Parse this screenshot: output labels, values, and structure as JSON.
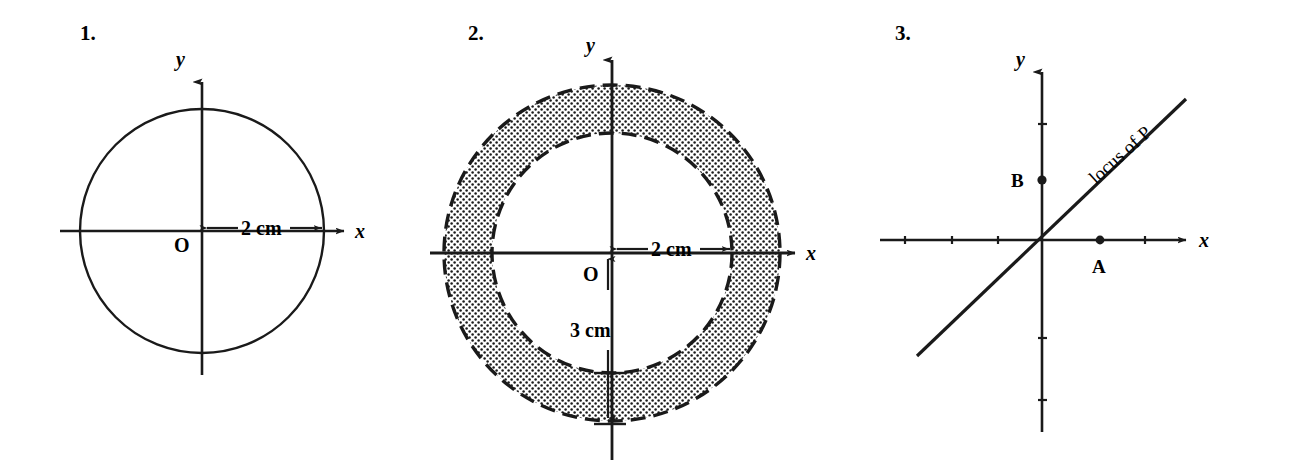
{
  "page": {
    "background_color": "#ffffff",
    "ink_color": "#1a1a1a",
    "width": 1299,
    "height": 464
  },
  "figures": [
    {
      "number": "1.",
      "type": "circle-locus",
      "axis_x_label": "x",
      "axis_y_label": "y",
      "origin_label": "O",
      "dimension_label": "2 cm",
      "description": "Solid circle centred on the origin O with radius 2 cm, marked by a double-headed dimension arrow along the positive x-axis.",
      "geometry": {
        "centre": [
          202,
          231
        ],
        "radius_px": 122,
        "radius_cm": 2,
        "stroke": "solid",
        "x_axis": [
          60,
          348
        ],
        "y_axis": [
          78,
          375
        ]
      }
    },
    {
      "number": "2.",
      "type": "annulus-locus",
      "axis_x_label": "x",
      "axis_y_label": "y",
      "origin_label": "O",
      "dimension_label_inner": "2 cm",
      "dimension_label_outer": "3 cm",
      "description": "Shaded annulus between two dashed circles centred on O; inner radius 2 cm shown by a horizontal double-headed arrow, outer radius 3 cm shown by a vertical double-headed arrow.",
      "geometry": {
        "centre": [
          612,
          253
        ],
        "inner_radius_px": 120,
        "outer_radius_px": 168,
        "inner_radius_cm": 2,
        "outer_radius_cm": 3,
        "stroke": "dashed",
        "fill": "stipple-dots",
        "x_axis": [
          425,
          800
        ],
        "y_axis": [
          55,
          460
        ]
      }
    },
    {
      "number": "3.",
      "type": "line-locus",
      "axis_x_label": "x",
      "axis_y_label": "y",
      "point_a_label": "A",
      "point_b_label": "B",
      "locus_label": "locus of P",
      "description": "Axes with tick marks; point A on the positive x-axis, point B on the positive y-axis, and a straight line of slope about 1 through the origin labelled locus of P.",
      "geometry": {
        "origin": [
          1042,
          240
        ],
        "point_a": [
          1100,
          240
        ],
        "point_b": [
          1042,
          180
        ],
        "line_from": [
          917,
          355
        ],
        "line_to": [
          1185,
          100
        ],
        "x_axis": [
          880,
          1190
        ],
        "y_axis": [
          68,
          432
        ],
        "tick_spacing_px": 30,
        "locus_label_rotation_deg": -42
      }
    }
  ]
}
